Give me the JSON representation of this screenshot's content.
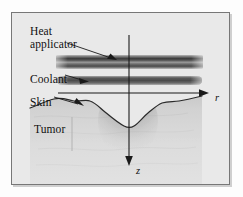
{
  "figure": {
    "background_color": "#e9e9e9",
    "frame_color": "#777777",
    "labels": {
      "heat_applicator": "Heat\napplicator",
      "heat_applicator_line1": "Heat",
      "heat_applicator_line2": "applicator",
      "coolant": "Coolant",
      "skin": "Skin",
      "tumor": "Tumor"
    },
    "axes": {
      "radial_label": "r",
      "axial_label": "z",
      "radial_direction": "right",
      "axial_direction": "down",
      "origin_x": 117,
      "origin_y": 85
    },
    "elements": {
      "applicator_band_color": "#6b6b6b",
      "coolant_band_color": "#7d7d7d",
      "skin_curve_color": "#2a2a2a",
      "tumor_plume_color": "#9a9a9a",
      "tissue_color": "#d6d6d6"
    }
  }
}
